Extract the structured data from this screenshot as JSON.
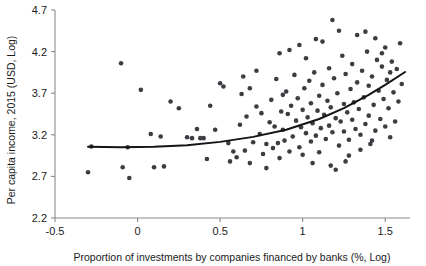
{
  "figure": {
    "title": "",
    "background_color": "#ffffff",
    "point_color": "#3c3c42",
    "line_color": "#141414",
    "axis_color": "#8a8a8a"
  },
  "axes": {
    "x_title": "Proportion of investments by companies financed by banks (%, Log)",
    "y_title": "Per capita income, 2015 (USD, Log)",
    "x_ticks": [
      "-0.5",
      "0",
      "0.5",
      "1",
      "1.5"
    ],
    "y_ticks": [
      "2.2",
      "2.7",
      "3.2",
      "3.7",
      "4.2",
      "4.7"
    ]
  },
  "chart_data": {
    "type": "scatter",
    "title": "",
    "xlabel": "Proportion of investments by companies financed by banks (%, Log)",
    "ylabel": "Per capita income, 2015 (USD, Log)",
    "xlim": [
      -0.5,
      1.65
    ],
    "ylim": [
      2.2,
      4.7
    ],
    "xticks": [
      -0.5,
      0,
      0.5,
      1,
      1.5
    ],
    "yticks": [
      2.2,
      2.7,
      3.2,
      3.7,
      4.2,
      4.7
    ],
    "grid": false,
    "legend": "none",
    "marker": "circle",
    "marker_size": 3,
    "points": [
      [
        -0.3,
        2.75
      ],
      [
        -0.28,
        3.06
      ],
      [
        -0.1,
        4.06
      ],
      [
        -0.09,
        2.81
      ],
      [
        -0.06,
        3.05
      ],
      [
        -0.05,
        2.68
      ],
      [
        0.02,
        3.74
      ],
      [
        0.08,
        3.21
      ],
      [
        0.1,
        2.81
      ],
      [
        0.14,
        3.18
      ],
      [
        0.16,
        2.82
      ],
      [
        0.2,
        3.6
      ],
      [
        0.25,
        3.52
      ],
      [
        0.3,
        3.17
      ],
      [
        0.33,
        3.16
      ],
      [
        0.36,
        3.27
      ],
      [
        0.38,
        3.16
      ],
      [
        0.4,
        3.16
      ],
      [
        0.42,
        2.91
      ],
      [
        0.44,
        3.55
      ],
      [
        0.47,
        3.26
      ],
      [
        0.5,
        3.82
      ],
      [
        0.52,
        3.78
      ],
      [
        0.55,
        3.1
      ],
      [
        0.56,
        2.88
      ],
      [
        0.58,
        3.0
      ],
      [
        0.6,
        2.93
      ],
      [
        0.62,
        3.32
      ],
      [
        0.63,
        3.69
      ],
      [
        0.65,
        3.01
      ],
      [
        0.66,
        3.42
      ],
      [
        0.68,
        2.86
      ],
      [
        0.7,
        3.11
      ],
      [
        0.72,
        3.54
      ],
      [
        0.74,
        3.21
      ],
      [
        0.75,
        3.46
      ],
      [
        0.76,
        2.97
      ],
      [
        0.78,
        3.09
      ],
      [
        0.8,
        3.35
      ],
      [
        0.81,
        3.62
      ],
      [
        0.82,
        3.04
      ],
      [
        0.83,
        3.3
      ],
      [
        0.84,
        3.87
      ],
      [
        0.85,
        3.1
      ],
      [
        0.86,
        2.92
      ],
      [
        0.87,
        3.48
      ],
      [
        0.88,
        3.26
      ],
      [
        0.89,
        3.13
      ],
      [
        0.9,
        3.72
      ],
      [
        0.91,
        3.45
      ],
      [
        0.92,
        3.0
      ],
      [
        0.93,
        3.55
      ],
      [
        0.94,
        3.18
      ],
      [
        0.95,
        3.92
      ],
      [
        0.96,
        3.37
      ],
      [
        0.97,
        3.64
      ],
      [
        0.98,
        3.05
      ],
      [
        0.99,
        3.29
      ],
      [
        1.0,
        3.5
      ],
      [
        1.0,
        2.96
      ],
      [
        1.01,
        3.76
      ],
      [
        1.02,
        3.22
      ],
      [
        1.03,
        3.41
      ],
      [
        1.04,
        3.85
      ],
      [
        1.05,
        3.12
      ],
      [
        1.05,
        3.58
      ],
      [
        1.06,
        3.34
      ],
      [
        1.07,
        3.95
      ],
      [
        1.08,
        3.19
      ],
      [
        1.09,
        3.49
      ],
      [
        1.1,
        3.67
      ],
      [
        1.1,
        2.99
      ],
      [
        1.11,
        3.28
      ],
      [
        1.12,
        3.8
      ],
      [
        1.13,
        3.44
      ],
      [
        1.14,
        3.15
      ],
      [
        1.15,
        3.61
      ],
      [
        1.16,
        4.0
      ],
      [
        1.16,
        3.31
      ],
      [
        1.17,
        3.53
      ],
      [
        1.18,
        3.23
      ],
      [
        1.19,
        3.88
      ],
      [
        1.2,
        3.4
      ],
      [
        1.2,
        2.78
      ],
      [
        1.21,
        3.7
      ],
      [
        1.22,
        3.07
      ],
      [
        1.23,
        3.36
      ],
      [
        1.24,
        4.15
      ],
      [
        1.25,
        3.57
      ],
      [
        1.25,
        3.24
      ],
      [
        1.26,
        3.93
      ],
      [
        1.27,
        3.47
      ],
      [
        1.28,
        3.14
      ],
      [
        1.29,
        3.75
      ],
      [
        1.3,
        3.38
      ],
      [
        1.3,
        4.05
      ],
      [
        1.31,
        3.59
      ],
      [
        1.32,
        3.27
      ],
      [
        1.33,
        3.83
      ],
      [
        1.34,
        3.51
      ],
      [
        1.35,
        3.2
      ],
      [
        1.36,
        3.97
      ],
      [
        1.37,
        3.65
      ],
      [
        1.38,
        3.33
      ],
      [
        1.39,
        4.2
      ],
      [
        1.4,
        3.79
      ],
      [
        1.4,
        3.43
      ],
      [
        1.41,
        3.09
      ],
      [
        1.42,
        3.9
      ],
      [
        1.43,
        3.56
      ],
      [
        1.44,
        3.25
      ],
      [
        1.45,
        4.1
      ],
      [
        1.46,
        3.73
      ],
      [
        1.47,
        3.39
      ],
      [
        1.48,
        4.02
      ],
      [
        1.49,
        3.63
      ],
      [
        1.5,
        3.3
      ],
      [
        1.5,
        4.25
      ],
      [
        1.51,
        3.86
      ],
      [
        1.52,
        3.52
      ],
      [
        1.53,
        3.17
      ],
      [
        1.54,
        4.08
      ],
      [
        1.55,
        3.71
      ],
      [
        1.56,
        3.36
      ],
      [
        1.57,
        3.99
      ],
      [
        1.58,
        3.6
      ],
      [
        1.59,
        4.3
      ],
      [
        1.6,
        3.81
      ],
      [
        1.18,
        4.58
      ],
      [
        1.33,
        4.4
      ],
      [
        1.08,
        4.35
      ],
      [
        0.98,
        4.28
      ],
      [
        1.22,
        4.45
      ],
      [
        0.86,
        4.18
      ],
      [
        1.02,
        4.12
      ],
      [
        0.92,
        4.22
      ],
      [
        1.12,
        4.32
      ],
      [
        1.44,
        4.36
      ],
      [
        1.48,
        4.18
      ],
      [
        1.38,
        4.44
      ],
      [
        0.72,
        3.97
      ],
      [
        0.64,
        3.9
      ],
      [
        1.26,
        2.88
      ],
      [
        1.17,
        2.83
      ],
      [
        1.28,
        2.95
      ],
      [
        1.35,
        3.02
      ],
      [
        1.42,
        3.13
      ],
      [
        1.53,
        3.95
      ],
      [
        0.78,
        2.8
      ],
      [
        0.68,
        3.76
      ],
      [
        0.88,
        3.68
      ],
      [
        1.06,
        2.86
      ]
    ],
    "fit_curve": {
      "label": "quadratic fit",
      "x_start": -0.3,
      "x_end": 1.62,
      "points": [
        [
          -0.3,
          3.055
        ],
        [
          -0.1,
          3.05
        ],
        [
          0.1,
          3.055
        ],
        [
          0.3,
          3.075
        ],
        [
          0.5,
          3.115
        ],
        [
          0.7,
          3.175
        ],
        [
          0.9,
          3.26
        ],
        [
          1.1,
          3.39
        ],
        [
          1.25,
          3.52
        ],
        [
          1.4,
          3.68
        ],
        [
          1.5,
          3.8
        ],
        [
          1.62,
          3.955
        ]
      ]
    }
  }
}
